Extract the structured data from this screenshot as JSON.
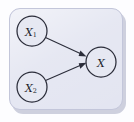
{
  "diagram": {
    "title": "",
    "type": "directed-acyclic-graph",
    "panel": {
      "background_color": "#e3e5f1",
      "border_color": "#c3c6da",
      "shadow_color": "#a9adc4"
    },
    "nodes": [
      {
        "id": "x1",
        "base": "X",
        "subscript": "1",
        "label": "X1",
        "cx": 32,
        "cy": 31,
        "r": 15
      },
      {
        "id": "x2",
        "base": "X",
        "subscript": "2",
        "label": "X2",
        "cx": 32,
        "cy": 87,
        "r": 15
      },
      {
        "id": "x",
        "base": "X",
        "subscript": "",
        "label": "X",
        "cx": 101,
        "cy": 62,
        "r": 15
      }
    ],
    "edges": [
      {
        "id": "x1-to-x",
        "from": "x1",
        "to": "x",
        "direction": "forward"
      },
      {
        "id": "x2-to-x",
        "from": "x2",
        "to": "x",
        "direction": "forward"
      }
    ],
    "stroke_color": "#2b2d3a"
  }
}
